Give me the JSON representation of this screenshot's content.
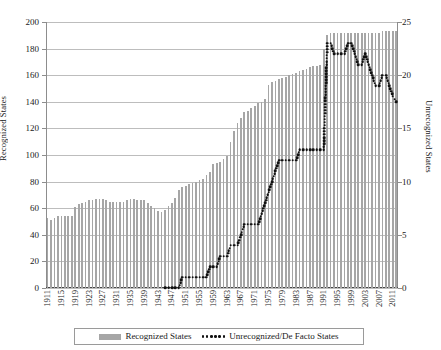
{
  "chart_data": {
    "type": "bar",
    "title": "",
    "xlabel": "",
    "ylabel": "Recognized States",
    "y2label": "Unrecognized States",
    "ylim": [
      0,
      200
    ],
    "y2lim": [
      0,
      25
    ],
    "grid": true,
    "legend_position": "bottom",
    "yticks": [
      0,
      20,
      40,
      60,
      80,
      100,
      120,
      140,
      160,
      180,
      200
    ],
    "y2ticks": [
      0,
      5,
      10,
      15,
      20,
      25
    ],
    "xtick_labels": [
      "1911",
      "1915",
      "1919",
      "1923",
      "1927",
      "1931",
      "1935",
      "1939",
      "1943",
      "1947",
      "1951",
      "1955",
      "1959",
      "1963",
      "1967",
      "1971",
      "1975",
      "1979",
      "1983",
      "1987",
      "1991",
      "1995",
      "1999",
      "2003",
      "2007",
      "2011"
    ],
    "xtick_step": 4,
    "x_start": 1911,
    "x_end": 2012,
    "categories": [
      1911,
      1912,
      1913,
      1914,
      1915,
      1916,
      1917,
      1918,
      1919,
      1920,
      1921,
      1922,
      1923,
      1924,
      1925,
      1926,
      1927,
      1928,
      1929,
      1930,
      1931,
      1932,
      1933,
      1934,
      1935,
      1936,
      1937,
      1938,
      1939,
      1940,
      1941,
      1942,
      1943,
      1944,
      1945,
      1946,
      1947,
      1948,
      1949,
      1950,
      1951,
      1952,
      1953,
      1954,
      1955,
      1956,
      1957,
      1958,
      1959,
      1960,
      1961,
      1962,
      1963,
      1964,
      1965,
      1966,
      1967,
      1968,
      1969,
      1970,
      1971,
      1972,
      1973,
      1974,
      1975,
      1976,
      1977,
      1978,
      1979,
      1980,
      1981,
      1982,
      1983,
      1984,
      1985,
      1986,
      1987,
      1988,
      1989,
      1990,
      1991,
      1992,
      1993,
      1994,
      1995,
      1996,
      1997,
      1998,
      1999,
      2000,
      2001,
      2002,
      2003,
      2004,
      2005,
      2006,
      2007,
      2008,
      2009,
      2010,
      2011,
      2012
    ],
    "series": [
      {
        "name": "Recognized States",
        "axis": "left",
        "color": "#a6a6a6",
        "values": [
          53,
          51,
          53,
          54,
          54,
          54,
          54,
          54,
          61,
          63,
          64,
          65,
          66,
          66,
          67,
          67,
          67,
          66,
          65,
          65,
          65,
          65,
          65,
          66,
          67,
          67,
          66,
          66,
          66,
          64,
          62,
          60,
          58,
          57,
          59,
          62,
          64,
          68,
          74,
          76,
          77,
          78,
          79,
          80,
          81,
          82,
          85,
          87,
          93,
          94,
          95,
          97,
          99,
          110,
          118,
          124,
          128,
          132,
          133,
          135,
          137,
          139,
          140,
          142,
          153,
          155,
          156,
          157,
          158,
          159,
          160,
          161,
          162,
          163,
          164,
          165,
          166,
          167,
          167,
          168,
          180,
          190,
          192,
          192,
          192,
          192,
          192,
          192,
          192,
          192,
          192,
          192,
          192,
          192,
          192,
          192,
          192,
          193,
          193,
          193,
          193,
          193
        ]
      },
      {
        "name": "Unrecognized/De Facto States",
        "axis": "right",
        "color": "#111111",
        "style": "dotted",
        "values": [
          null,
          null,
          null,
          null,
          null,
          null,
          null,
          null,
          null,
          null,
          null,
          null,
          null,
          null,
          null,
          null,
          null,
          null,
          null,
          null,
          null,
          null,
          null,
          null,
          null,
          null,
          null,
          null,
          null,
          null,
          null,
          null,
          null,
          null,
          0,
          0,
          0,
          0,
          0,
          1,
          1,
          1,
          1,
          1,
          1,
          1,
          1,
          2,
          2,
          2,
          3,
          3,
          3,
          4,
          4,
          4,
          5,
          6,
          6,
          6,
          6,
          6,
          7,
          8,
          9,
          10,
          11,
          12,
          12,
          12,
          12,
          12,
          12,
          13,
          13,
          13,
          13,
          13,
          13,
          13,
          13,
          23,
          23,
          22,
          22,
          22,
          22,
          23,
          23,
          22,
          21,
          21,
          22,
          21,
          20,
          19,
          19,
          20,
          20,
          19,
          18,
          17.5
        ]
      }
    ]
  },
  "legend": {
    "items": [
      {
        "label": "Recognized States",
        "marker": "bar-swatch"
      },
      {
        "label": "Unrecognized/De Facto States",
        "marker": "dotted-line"
      }
    ]
  },
  "axes": {
    "left_title": "Recognized States",
    "right_title": "Unrecognized States"
  }
}
